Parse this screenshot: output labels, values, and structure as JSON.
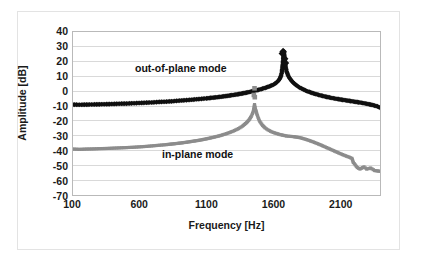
{
  "chart_data": {
    "type": "line",
    "title": "",
    "xlabel": "Frequency [Hz]",
    "ylabel": "Amplitude [dB]",
    "xlim": [
      100,
      2400
    ],
    "ylim": [
      -70,
      40
    ],
    "xticks": [
      100,
      600,
      1100,
      1600,
      2100
    ],
    "yticks": [
      40,
      30,
      20,
      10,
      0,
      -10,
      -20,
      -30,
      -40,
      -50,
      -60,
      -70
    ],
    "grid": "horizontal",
    "legend_position": "inline-annotations",
    "annotations": [
      {
        "text": "out-of-plane mode",
        "x": 1000,
        "y": 14
      },
      {
        "text": "in-plane mode",
        "x": 1250,
        "y": -43
      }
    ],
    "series": [
      {
        "name": "out-of-plane mode",
        "color": "#101010",
        "marker": "diamond",
        "resonance_frequency": 1680,
        "peak_amplitude": 27,
        "points": [
          [
            100,
            -9.0
          ],
          [
            150,
            -9.1
          ],
          [
            200,
            -9.0
          ],
          [
            250,
            -8.9
          ],
          [
            300,
            -8.8
          ],
          [
            350,
            -8.7
          ],
          [
            400,
            -8.6
          ],
          [
            450,
            -8.4
          ],
          [
            500,
            -8.3
          ],
          [
            550,
            -8.1
          ],
          [
            600,
            -7.9
          ],
          [
            650,
            -7.7
          ],
          [
            700,
            -7.5
          ],
          [
            750,
            -7.2
          ],
          [
            800,
            -7.0
          ],
          [
            850,
            -6.7
          ],
          [
            900,
            -6.3
          ],
          [
            950,
            -6.0
          ],
          [
            1000,
            -5.6
          ],
          [
            1050,
            -5.2
          ],
          [
            1100,
            -4.8
          ],
          [
            1150,
            -4.3
          ],
          [
            1200,
            -3.8
          ],
          [
            1250,
            -3.2
          ],
          [
            1300,
            -2.5
          ],
          [
            1350,
            -1.8
          ],
          [
            1400,
            -0.9
          ],
          [
            1450,
            0.1
          ],
          [
            1500,
            1.2
          ],
          [
            1550,
            2.6
          ],
          [
            1580,
            3.6
          ],
          [
            1600,
            4.4
          ],
          [
            1620,
            5.5
          ],
          [
            1640,
            7.2
          ],
          [
            1650,
            8.6
          ],
          [
            1660,
            11.0
          ],
          [
            1665,
            13.0
          ],
          [
            1670,
            16.5
          ],
          [
            1675,
            21.0
          ],
          [
            1678,
            24.5
          ],
          [
            1680,
            27.0
          ],
          [
            1683,
            24.0
          ],
          [
            1686,
            21.5
          ],
          [
            1690,
            18.0
          ],
          [
            1695,
            15.5
          ],
          [
            1700,
            13.5
          ],
          [
            1710,
            11.0
          ],
          [
            1720,
            9.2
          ],
          [
            1740,
            6.8
          ],
          [
            1760,
            5.0
          ],
          [
            1780,
            3.6
          ],
          [
            1800,
            2.4
          ],
          [
            1850,
            0.2
          ],
          [
            1900,
            -1.4
          ],
          [
            1950,
            -2.7
          ],
          [
            2000,
            -3.8
          ],
          [
            2050,
            -4.7
          ],
          [
            2100,
            -5.5
          ],
          [
            2150,
            -6.2
          ],
          [
            2200,
            -6.9
          ],
          [
            2250,
            -7.6
          ],
          [
            2300,
            -8.4
          ],
          [
            2350,
            -9.4
          ],
          [
            2380,
            -10.2
          ],
          [
            2400,
            -11.0
          ]
        ],
        "outlier_markers": [
          [
            1668,
            25.5
          ],
          [
            1674,
            26.8
          ],
          [
            1686,
            22.0
          ],
          [
            1692,
            19.0
          ]
        ]
      },
      {
        "name": "in-plane mode",
        "color": "#8c8c8c",
        "marker": "square",
        "resonance_frequency": 1460,
        "peak_amplitude": -9,
        "points": [
          [
            100,
            -39.0
          ],
          [
            150,
            -39.2
          ],
          [
            200,
            -39.0
          ],
          [
            250,
            -38.9
          ],
          [
            300,
            -38.7
          ],
          [
            350,
            -38.6
          ],
          [
            400,
            -38.4
          ],
          [
            450,
            -38.2
          ],
          [
            500,
            -38.0
          ],
          [
            550,
            -37.8
          ],
          [
            600,
            -37.5
          ],
          [
            650,
            -37.2
          ],
          [
            700,
            -36.8
          ],
          [
            750,
            -36.4
          ],
          [
            800,
            -36.0
          ],
          [
            850,
            -35.5
          ],
          [
            900,
            -35.0
          ],
          [
            950,
            -34.4
          ],
          [
            1000,
            -33.7
          ],
          [
            1050,
            -33.0
          ],
          [
            1100,
            -32.1
          ],
          [
            1150,
            -31.1
          ],
          [
            1200,
            -30.0
          ],
          [
            1250,
            -28.6
          ],
          [
            1300,
            -26.9
          ],
          [
            1340,
            -25.2
          ],
          [
            1370,
            -23.5
          ],
          [
            1400,
            -21.2
          ],
          [
            1420,
            -19.2
          ],
          [
            1435,
            -17.0
          ],
          [
            1445,
            -15.0
          ],
          [
            1452,
            -13.2
          ],
          [
            1456,
            -11.5
          ],
          [
            1460,
            -9.0
          ],
          [
            1464,
            -11.0
          ],
          [
            1470,
            -13.0
          ],
          [
            1478,
            -15.5
          ],
          [
            1490,
            -18.5
          ],
          [
            1500,
            -20.5
          ],
          [
            1520,
            -23.0
          ],
          [
            1540,
            -24.8
          ],
          [
            1560,
            -26.0
          ],
          [
            1580,
            -27.0
          ],
          [
            1600,
            -27.8
          ],
          [
            1650,
            -29.2
          ],
          [
            1700,
            -30.2
          ],
          [
            1750,
            -30.6
          ],
          [
            1800,
            -31.3
          ],
          [
            1850,
            -32.6
          ],
          [
            1900,
            -34.2
          ],
          [
            1950,
            -36.0
          ],
          [
            2000,
            -38.0
          ],
          [
            2050,
            -40.0
          ],
          [
            2100,
            -42.0
          ],
          [
            2140,
            -43.5
          ],
          [
            2170,
            -44.5
          ],
          [
            2190,
            -45.3
          ],
          [
            2200,
            -48.0
          ],
          [
            2230,
            -51.5
          ],
          [
            2250,
            -52.5
          ],
          [
            2280,
            -51.0
          ],
          [
            2300,
            -52.5
          ],
          [
            2330,
            -51.8
          ],
          [
            2360,
            -53.5
          ],
          [
            2400,
            -54.0
          ]
        ],
        "outlier_markers": [
          [
            1455,
            -2.5
          ],
          [
            1460,
            2.0
          ],
          [
            1462,
            -4.0
          ]
        ]
      }
    ]
  },
  "axis": {
    "y_label": "Amplitude [dB]",
    "x_label": "Frequency [Hz]",
    "y_ticks": [
      "40",
      "30",
      "20",
      "10",
      "0",
      "-10",
      "-20",
      "-30",
      "-40",
      "-50",
      "-60",
      "-70"
    ],
    "x_ticks": [
      "100",
      "600",
      "1100",
      "1600",
      "2100"
    ]
  },
  "annotations": {
    "out_of_plane": "out-of-plane mode",
    "in_plane": "in-plane mode"
  },
  "colors": {
    "out_of_plane_series": "#101010",
    "in_plane_series": "#8c8c8c",
    "gridline": "#d9d9d9",
    "plot_border": "#b9b9b9",
    "figure_border": "#e3e3e3",
    "text": "#1a1a1a",
    "background": "#ffffff"
  }
}
